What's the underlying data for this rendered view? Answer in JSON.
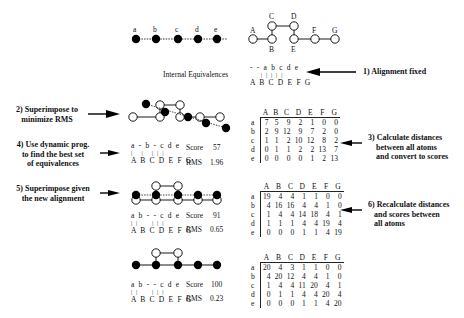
{
  "top": {
    "query_chain": {
      "labels": [
        "a",
        "b",
        "c",
        "d",
        "e"
      ]
    },
    "target_chain": {
      "labels": [
        "A",
        "B",
        "C",
        "D",
        "E",
        "F",
        "G"
      ]
    },
    "internal_equivalences_label": "Internal Equivalences",
    "fixed_alignment": {
      "top": "- - a b c d e",
      "bars": "    | | | | |",
      "bottom": "A B C D E F G"
    }
  },
  "steps": {
    "s1": "1) Alignment fixed",
    "s2_line1": "2) Superimpose to",
    "s2_line2": "minimize RMS",
    "s3_line1": "3) Calculate distances",
    "s3_line2": "between all atoms",
    "s3_line3": "and convert to scores",
    "s4_line1": "4) Use dynamic prog.",
    "s4_line2": "to find the best set",
    "s4_line3": "of equivalences",
    "s5_line1": "5) Superimpose given",
    "s5_line2": "the new alignment",
    "s6_line1": "6) Recalculate distances",
    "s6_line2": "and scores between",
    "s6_line3": "all atoms"
  },
  "alignments": [
    {
      "top": "a - b - c d e",
      "bars": "|   |   | | |",
      "bottom": "A B C D E F G",
      "score_label": "Score",
      "score": "57",
      "rms_label": "RMS",
      "rms": "1.96"
    },
    {
      "top": "a b - - c d e",
      "bars": "| |     | | |",
      "bottom": "A B C D E F G",
      "score_label": "Score",
      "score": "91",
      "rms_label": "RMS",
      "rms": "0.65"
    },
    {
      "top": "a b - - c d e",
      "bars": "| |     | | |",
      "bottom": "A B C D E F G",
      "score_label": "Score",
      "score": "100",
      "rms_label": "RMS",
      "rms": "0.23"
    }
  ],
  "matrices": [
    {
      "cols": [
        "A",
        "B",
        "C",
        "D",
        "E",
        "F",
        "G"
      ],
      "rows": [
        {
          "h": "a",
          "v": [
            "7",
            "5",
            "9",
            "2",
            "1",
            "0",
            "0"
          ]
        },
        {
          "h": "b",
          "v": [
            "2",
            "9",
            "12",
            "9",
            "7",
            "2",
            "0"
          ]
        },
        {
          "h": "c",
          "v": [
            "1",
            "1",
            "2",
            "10",
            "12",
            "8",
            "2"
          ]
        },
        {
          "h": "d",
          "v": [
            "0",
            "1",
            "1",
            "2",
            "2",
            "13",
            "7"
          ]
        },
        {
          "h": "e",
          "v": [
            "0",
            "0",
            "0",
            "0",
            "1",
            "2",
            "13"
          ]
        }
      ]
    },
    {
      "cols": [
        "A",
        "B",
        "C",
        "D",
        "E",
        "F",
        "G"
      ],
      "rows": [
        {
          "h": "a",
          "v": [
            "19",
            "4",
            "4",
            "1",
            "1",
            "0",
            "0"
          ]
        },
        {
          "h": "b",
          "v": [
            "4",
            "16",
            "16",
            "4",
            "4",
            "1",
            "0"
          ]
        },
        {
          "h": "c",
          "v": [
            "1",
            "4",
            "4",
            "14",
            "18",
            "4",
            "1"
          ]
        },
        {
          "h": "d",
          "v": [
            "1",
            "1",
            "1",
            "4",
            "4",
            "19",
            "4"
          ]
        },
        {
          "h": "e",
          "v": [
            "0",
            "0",
            "0",
            "1",
            "1",
            "4",
            "19"
          ]
        }
      ]
    },
    {
      "cols": [
        "A",
        "B",
        "C",
        "D",
        "E",
        "F",
        "G"
      ],
      "rows": [
        {
          "h": "a",
          "v": [
            "20",
            "4",
            "3",
            "1",
            "1",
            "0",
            "0"
          ]
        },
        {
          "h": "b",
          "v": [
            "4",
            "20",
            "12",
            "4",
            "4",
            "1",
            "0"
          ]
        },
        {
          "h": "c",
          "v": [
            "1",
            "4",
            "4",
            "11",
            "20",
            "4",
            "1"
          ]
        },
        {
          "h": "d",
          "v": [
            "0",
            "1",
            "1",
            "4",
            "4",
            "20",
            "4"
          ]
        },
        {
          "h": "e",
          "v": [
            "0",
            "0",
            "0",
            "1",
            "1",
            "4",
            "20"
          ]
        }
      ]
    }
  ],
  "colors": {
    "ink": "#111111",
    "background": "#ffffff"
  }
}
